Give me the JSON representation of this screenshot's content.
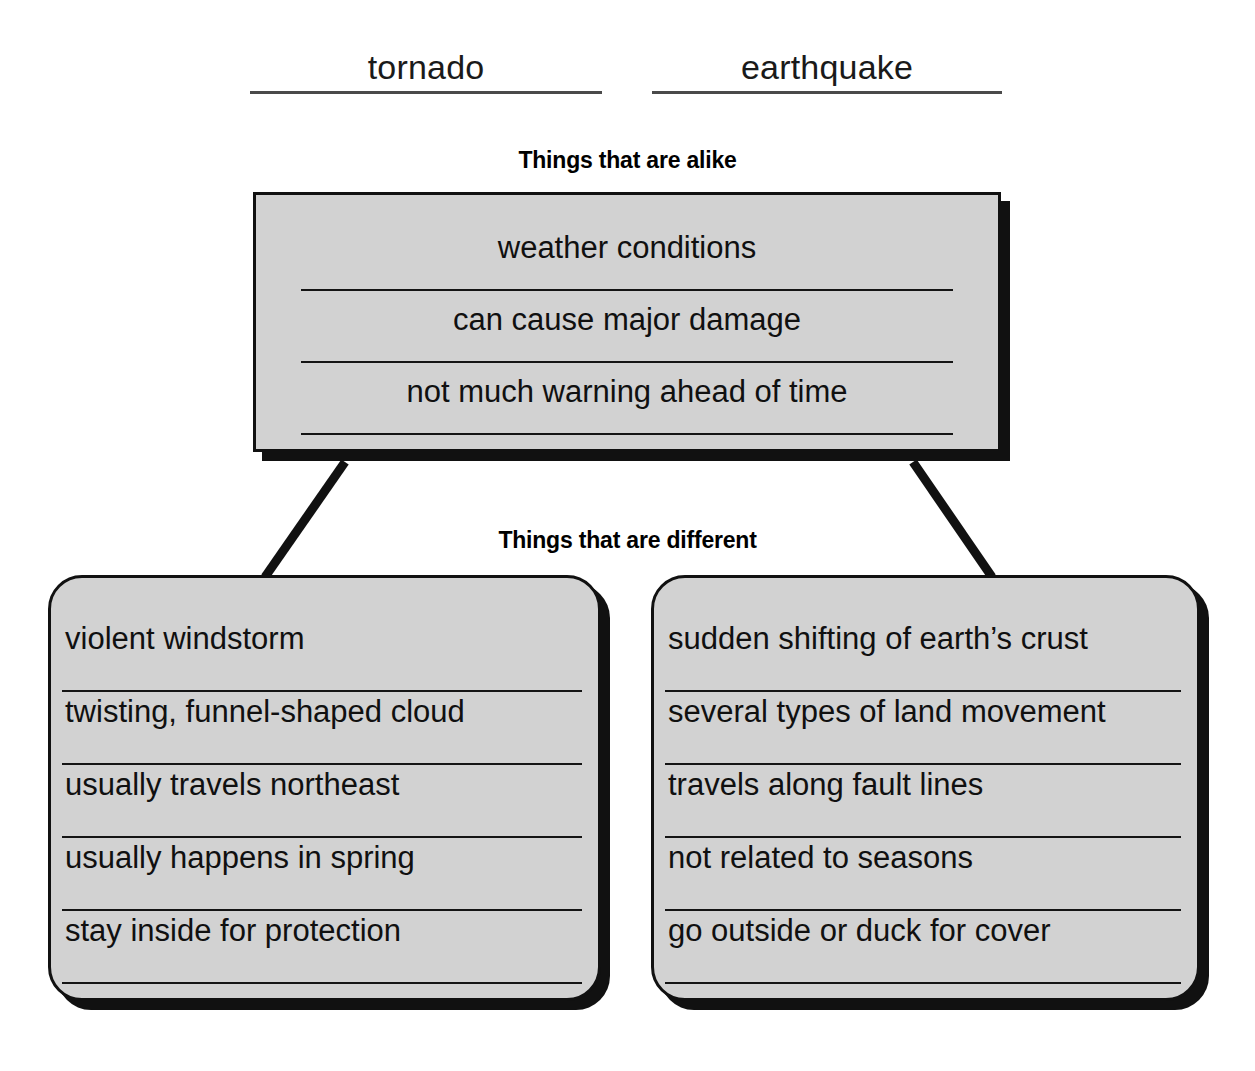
{
  "subjects": [
    {
      "name": "subject-a",
      "label": "tornado"
    },
    {
      "name": "subject-b",
      "label": "earthquake"
    }
  ],
  "captions": {
    "alike": "Things that are alike",
    "different": "Things that are different"
  },
  "alike_box": {
    "entries": [
      "weather conditions",
      "can cause major damage",
      "not much warning ahead of time"
    ]
  },
  "different_boxes": [
    {
      "name": "tornado-differences",
      "entries": [
        "violent windstorm",
        "twisting, funnel-shaped cloud",
        "usually travels northeast",
        "usually happens in spring",
        "stay inside for protection"
      ]
    },
    {
      "name": "earthquake-differences",
      "entries": [
        "sudden shifting of earth’s crust",
        "several types of land movement",
        "travels along fault lines",
        "not related to seasons",
        "go outside or duck for cover"
      ]
    }
  ],
  "colors": {
    "box_fill": "#d2d2d2",
    "box_border": "#111111",
    "shadow": "#111111",
    "rule": "#141414",
    "heading_rule": "#4a4a4a",
    "text": "#101010",
    "background": "#ffffff"
  }
}
